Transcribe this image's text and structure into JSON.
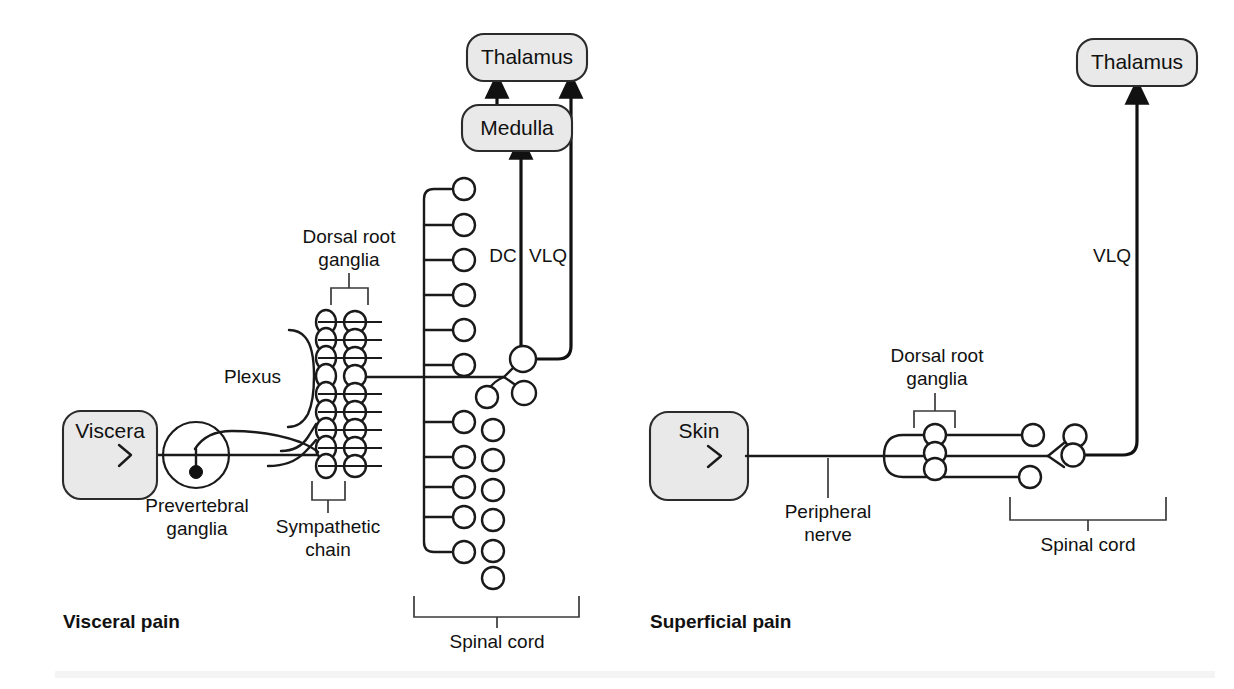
{
  "figure": {
    "background_color": "#ffffff",
    "box_fill_color": "#e9e9e9",
    "line_color": "#1a1a1a"
  },
  "sections": [
    {
      "id": "visceral",
      "title": "Visceral pain"
    },
    {
      "id": "superficial",
      "title": "Superficial pain"
    }
  ],
  "boxes": {
    "thalamus_left": "Thalamus",
    "medulla": "Medulla",
    "viscera": "Viscera",
    "thalamus_right": "Thalamus",
    "skin": "Skin"
  },
  "annotations": {
    "dorsal_root_ganglia_left": {
      "line1": "Dorsal root",
      "line2": "ganglia"
    },
    "plexus": "Plexus",
    "prevertebral_ganglia": {
      "line1": "Prevertebral",
      "line2": "ganglia"
    },
    "sympathetic_chain": {
      "line1": "Sympathetic",
      "line2": "chain"
    },
    "spinal_cord_left": "Spinal cord",
    "peripheral_nerve": {
      "line1": "Peripheral",
      "line2": "nerve"
    },
    "dorsal_root_ganglia_right": {
      "line1": "Dorsal root",
      "line2": "ganglia"
    },
    "spinal_cord_right": "Spinal cord"
  },
  "tracts": {
    "dc_left": "DC",
    "vlq_left": "VLQ",
    "vlq_right": "VLQ"
  },
  "counts": {
    "spinal_cord_left_upper_neurons": 6,
    "spinal_cord_left_lower_neurons": 6,
    "spinal_cord_left_inner_column_neurons": 7,
    "sympathetic_chain_ganglia": 9,
    "dorsal_root_ganglia_left_count": 9,
    "dorsal_root_ganglia_right_count": 3
  }
}
